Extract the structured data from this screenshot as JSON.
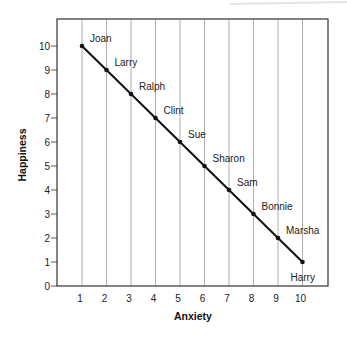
{
  "chart_data": {
    "type": "line",
    "title": "",
    "xlabel": "Anxiety",
    "ylabel": "Happiness",
    "xlim": [
      0,
      11
    ],
    "ylim": [
      0,
      10.8
    ],
    "x_ticks": [
      1,
      2,
      3,
      4,
      5,
      6,
      7,
      8,
      9,
      10
    ],
    "y_ticks": [
      0,
      1,
      2,
      3,
      4,
      5,
      6,
      7,
      8,
      9,
      10
    ],
    "grid": "vertical",
    "legend": null,
    "series": [
      {
        "name": "People",
        "points": [
          {
            "label": "Joan",
            "x": 1,
            "y": 10
          },
          {
            "label": "Larry",
            "x": 2,
            "y": 9
          },
          {
            "label": "Ralph",
            "x": 3,
            "y": 8
          },
          {
            "label": "Clint",
            "x": 4,
            "y": 7
          },
          {
            "label": "Sue",
            "x": 5,
            "y": 6
          },
          {
            "label": "Sharon",
            "x": 6,
            "y": 5
          },
          {
            "label": "Sam",
            "x": 7,
            "y": 4
          },
          {
            "label": "Bonnie",
            "x": 8,
            "y": 3
          },
          {
            "label": "Marsha",
            "x": 9,
            "y": 2
          },
          {
            "label": "Harry",
            "x": 10,
            "y": 1
          }
        ]
      }
    ]
  },
  "colors": {
    "line": "#111111",
    "grid": "#9a9a9a",
    "axis": "#333333"
  }
}
